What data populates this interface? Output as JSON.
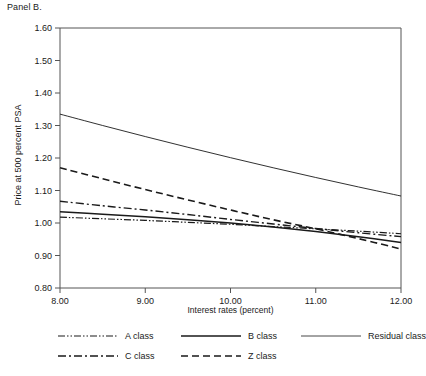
{
  "panel": {
    "title": "Panel B."
  },
  "axes": {
    "ylabel": "Price at 500 percent PSA",
    "xlabel": "Interest rates (percent)",
    "y_ticks": [
      "0.80",
      "0.90",
      "1.00",
      "1.10",
      "1.20",
      "1.30",
      "1.40",
      "1.50",
      "1.60"
    ],
    "x_ticks": [
      "8.00",
      "9.00",
      "10.00",
      "11.00",
      "12.00"
    ]
  },
  "legend": {
    "items": [
      {
        "label": "A class",
        "style": "dash-dot-dot",
        "key": "a"
      },
      {
        "label": "B class",
        "style": "solid-thick",
        "key": "b"
      },
      {
        "label": "Residual class",
        "style": "solid-thin",
        "key": "residual"
      },
      {
        "label": "C class",
        "style": "dash-dot",
        "key": "c"
      },
      {
        "label": "Z class",
        "style": "dashed",
        "key": "z"
      }
    ]
  },
  "colors": {
    "ink": "#1a1a1a",
    "axis": "#555555",
    "background": "#ffffff"
  },
  "chart_data": {
    "type": "line",
    "title": "Panel B.",
    "xlabel": "Interest rates (percent)",
    "ylabel": "Price at 500 percent PSA",
    "xlim": [
      8.0,
      12.0
    ],
    "ylim": [
      0.8,
      1.6
    ],
    "grid": false,
    "legend_position": "bottom",
    "x": [
      8.0,
      8.5,
      9.0,
      9.5,
      10.0,
      10.5,
      11.0,
      11.5,
      12.0
    ],
    "series": [
      {
        "name": "Residual class",
        "style": "solid-thin",
        "values": [
          1.335,
          1.3,
          1.266,
          1.233,
          1.201,
          1.17,
          1.14,
          1.111,
          1.083
        ]
      },
      {
        "name": "Z class",
        "style": "dashed",
        "values": [
          1.17,
          1.136,
          1.103,
          1.071,
          1.04,
          1.01,
          0.982,
          0.952,
          0.92
        ]
      },
      {
        "name": "C class",
        "style": "dash-dot",
        "values": [
          1.067,
          1.053,
          1.04,
          1.026,
          1.011,
          0.997,
          0.983,
          0.97,
          0.958
        ]
      },
      {
        "name": "B class",
        "style": "solid-thick",
        "values": [
          1.035,
          1.027,
          1.019,
          1.01,
          1.0,
          0.988,
          0.974,
          0.958,
          0.94
        ]
      },
      {
        "name": "A class",
        "style": "dash-dot-dot",
        "values": [
          1.018,
          1.013,
          1.008,
          1.002,
          0.996,
          0.989,
          0.982,
          0.975,
          0.967
        ]
      }
    ]
  }
}
